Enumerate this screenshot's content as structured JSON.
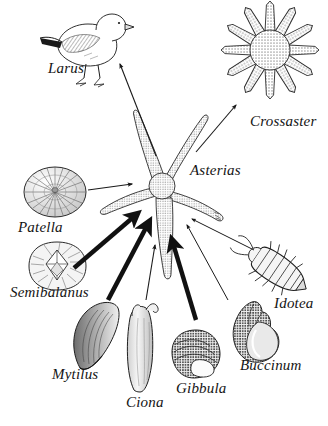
{
  "figure": {
    "kind": "food-web-diagram",
    "background_color": "#ffffff",
    "ink_color": "#1a1a1a",
    "caption_style": "italic-serif"
  },
  "nodes": [
    {
      "id": "larus",
      "label": "Larus",
      "icon": "seagull-icon",
      "label_x": 48,
      "label_y": 60,
      "font_size": 15,
      "art_x": 40,
      "art_y": 12,
      "art_w": 92,
      "art_h": 78
    },
    {
      "id": "crossaster",
      "label": "Crossaster",
      "icon": "sun-star-icon",
      "label_x": 250,
      "label_y": 113,
      "font_size": 15,
      "art_x": 218,
      "art_y": 2,
      "art_w": 106,
      "art_h": 100
    },
    {
      "id": "asterias",
      "label": "Asterias",
      "icon": "starfish-icon",
      "label_x": 190,
      "label_y": 162,
      "font_size": 15,
      "art_x": 96,
      "art_y": 105,
      "art_w": 140,
      "art_h": 190
    },
    {
      "id": "patella",
      "label": "Patella",
      "icon": "limpet-shell-icon",
      "label_x": 18,
      "label_y": 219,
      "font_size": 15,
      "art_x": 22,
      "art_y": 166,
      "art_w": 66,
      "art_h": 52
    },
    {
      "id": "semibalanus",
      "label": "Semibalanus",
      "icon": "barnacle-icon",
      "label_x": 10,
      "label_y": 284,
      "font_size": 15,
      "art_x": 26,
      "art_y": 243,
      "art_w": 62,
      "art_h": 46
    },
    {
      "id": "mytilus",
      "label": "Mytilus",
      "icon": "mussel-icon",
      "label_x": 52,
      "label_y": 366,
      "font_size": 15,
      "art_x": 72,
      "art_y": 300,
      "art_w": 48,
      "art_h": 68
    },
    {
      "id": "ciona",
      "label": "Ciona",
      "icon": "sea-squirt-icon",
      "label_x": 126,
      "label_y": 394,
      "font_size": 15,
      "art_x": 122,
      "art_y": 305,
      "art_w": 46,
      "art_h": 86
    },
    {
      "id": "gibbula",
      "label": "Gibbula",
      "icon": "topshell-icon",
      "label_x": 176,
      "label_y": 380,
      "font_size": 15,
      "art_x": 170,
      "art_y": 330,
      "art_w": 52,
      "art_h": 48
    },
    {
      "id": "buccinum",
      "label": "Buccinum",
      "icon": "whelk-shell-icon",
      "label_x": 240,
      "label_y": 357,
      "font_size": 15,
      "art_x": 226,
      "art_y": 300,
      "art_w": 58,
      "art_h": 62
    },
    {
      "id": "idotea",
      "label": "Idotea",
      "icon": "isopod-icon",
      "label_x": 274,
      "label_y": 295,
      "font_size": 15,
      "art_x": 250,
      "art_y": 240,
      "art_w": 58,
      "art_h": 60
    }
  ],
  "links": [
    {
      "from": "asterias",
      "to": "larus",
      "weight": "thin",
      "x1": 156,
      "y1": 156,
      "x2": 120,
      "y2": 64
    },
    {
      "from": "asterias",
      "to": "crossaster",
      "weight": "thin",
      "x1": 196,
      "y1": 152,
      "x2": 236,
      "y2": 105
    },
    {
      "from": "patella",
      "to": "asterias",
      "weight": "thin",
      "x1": 88,
      "y1": 190,
      "x2": 132,
      "y2": 184
    },
    {
      "from": "semibalanus",
      "to": "asterias",
      "weight": "thick",
      "x1": 74,
      "y1": 268,
      "x2": 137,
      "y2": 214
    },
    {
      "from": "mytilus",
      "to": "asterias",
      "weight": "thick",
      "x1": 108,
      "y1": 300,
      "x2": 149,
      "y2": 222
    },
    {
      "from": "ciona",
      "to": "asterias",
      "weight": "thin",
      "x1": 146,
      "y1": 300,
      "x2": 155,
      "y2": 245
    },
    {
      "from": "gibbula",
      "to": "asterias",
      "weight": "thick",
      "x1": 196,
      "y1": 320,
      "x2": 172,
      "y2": 240
    },
    {
      "from": "buccinum",
      "to": "asterias",
      "weight": "thin",
      "x1": 228,
      "y1": 300,
      "x2": 187,
      "y2": 225
    },
    {
      "from": "idotea",
      "to": "asterias",
      "weight": "thin",
      "x1": 254,
      "y1": 250,
      "x2": 192,
      "y2": 219
    }
  ]
}
